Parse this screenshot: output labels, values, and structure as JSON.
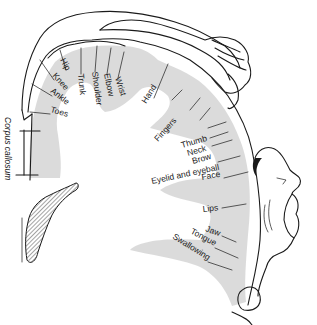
{
  "figure": {
    "colors": {
      "ink": "#1a1a1a",
      "cortex_shading": "#cfcfcf",
      "background": "#ffffff"
    }
  },
  "labels": {
    "hip": "Hip",
    "knee": "Knee",
    "ankle": "Ankle",
    "toes": "Toes",
    "trunk": "Trunk",
    "shoulder": "Shoulder",
    "elbow": "Elbow",
    "wrist": "Wrist",
    "hand": "Hand",
    "fingers": "Fingers",
    "thumb": "Thumb",
    "neck": "Neck",
    "brow": "Brow",
    "eyelid_eyeball": "Eyelid and eyeball",
    "face": "Face",
    "lips": "Lips",
    "jaw": "Jaw",
    "tongue": "Tongue",
    "swallowing": "Swallowing",
    "corpus_callosum": "Corpus callosum"
  }
}
